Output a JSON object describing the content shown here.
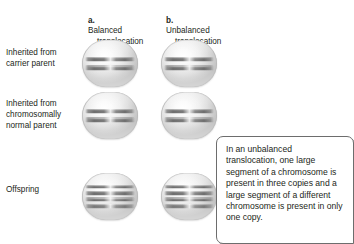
{
  "figure": {
    "columns": [
      {
        "marker": "a.",
        "line1": "Balanced",
        "line2": "translocation"
      },
      {
        "marker": "b.",
        "line1": "Unbalanced",
        "line2": "translocation"
      }
    ],
    "row_labels": [
      "Inherited from\ncarrier parent",
      "Inherited from\nchromosomally\nnormal parent",
      "Offspring"
    ],
    "cells": [
      {
        "row": 0,
        "col": 0,
        "chromosome_count": 2
      },
      {
        "row": 0,
        "col": 1,
        "chromosome_count": 2
      },
      {
        "row": 1,
        "col": 0,
        "chromosome_count": 2
      },
      {
        "row": 1,
        "col": 1,
        "chromosome_count": 2
      },
      {
        "row": 2,
        "col": 0,
        "chromosome_count": 4
      },
      {
        "row": 2,
        "col": 1,
        "chromosome_count": 4
      }
    ],
    "caption": "In an unbalanced translocation, one large segment of a chromosome is present in three copies and a large segment of a different chromosome is present in only one copy.",
    "colors": {
      "text": "#231f20",
      "cell_fill_light": "#ffffff",
      "cell_fill_dark": "#c4c4c4",
      "cell_outline": "#b9b9b9",
      "chromosome_dark": "#6e6e6e",
      "chromosome_mid": "#8f8f8f",
      "caption_border": "#6d6d6d",
      "caption_shadow": "#6e6e6e",
      "background": "#ffffff"
    }
  }
}
